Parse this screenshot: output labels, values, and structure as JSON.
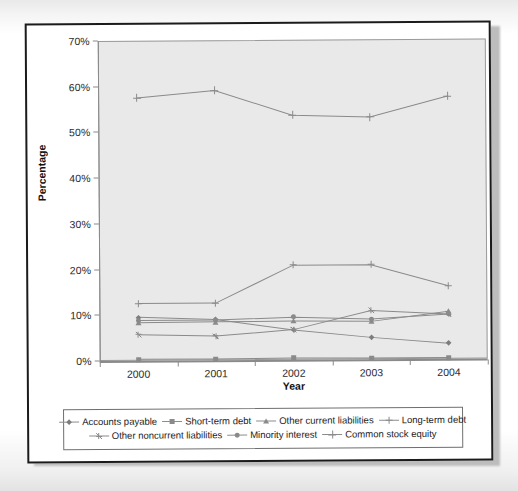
{
  "chart_data": {
    "type": "line",
    "title": "",
    "xlabel": "Year",
    "ylabel": "Percentage",
    "categories": [
      "2000",
      "2001",
      "2002",
      "2003",
      "2004"
    ],
    "x_tick_labels": [
      "2000",
      "2001",
      "2002",
      "2003",
      "2004"
    ],
    "y_tick_labels": [
      "0%",
      "10%",
      "20%",
      "30%",
      "40%",
      "50%",
      "60%",
      "70%"
    ],
    "y_tick_values": [
      0,
      10,
      20,
      30,
      40,
      50,
      60,
      70
    ],
    "ylim": [
      0,
      70
    ],
    "grid": false,
    "legend_position": "bottom",
    "plot_background": "#e9e9e9",
    "line_color": "#8a8a8a",
    "series": [
      {
        "name": "Accounts payable",
        "marker": "diamond",
        "values": [
          9.5,
          8.9,
          6.5,
          4.8,
          3.4
        ]
      },
      {
        "name": "Short-term debt",
        "marker": "square",
        "values": [
          0.3,
          0.3,
          0.4,
          0.3,
          0.3
        ]
      },
      {
        "name": "Other current liabilities",
        "marker": "triangle",
        "values": [
          8.3,
          8.4,
          8.5,
          8.3,
          10.4
        ]
      },
      {
        "name": "Long-term debt",
        "marker": "cross",
        "values": [
          12.5,
          12.5,
          20.7,
          20.7,
          16.0
        ]
      },
      {
        "name": "Other noncurrent liabilities",
        "marker": "star",
        "values": [
          5.7,
          5.3,
          6.6,
          10.7,
          9.8
        ]
      },
      {
        "name": "Minority interest",
        "marker": "circle",
        "values": [
          8.8,
          8.8,
          9.3,
          8.8,
          9.8
        ]
      },
      {
        "name": "Common stock equity",
        "marker": "plus",
        "values": [
          57.5,
          59.0,
          53.5,
          53.0,
          57.5
        ]
      }
    ]
  }
}
